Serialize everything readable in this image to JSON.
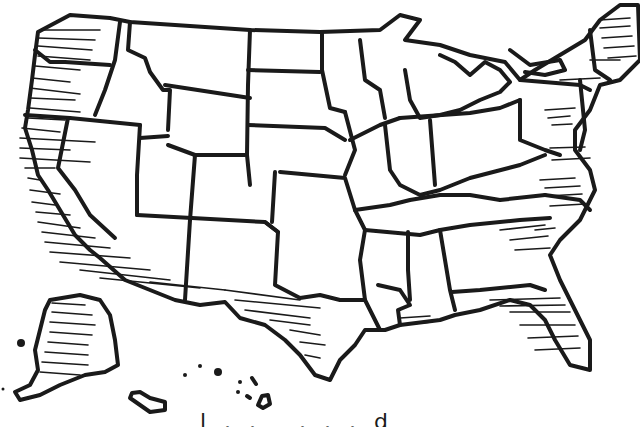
{
  "map": {
    "title": "",
    "style": "hand-drawn outline map",
    "subject": "United States",
    "stroke_color": "#1a1a1a",
    "fill_color": "#ffffff",
    "hatched_regions": [
      "Washington",
      "Oregon",
      "California",
      "Nevada (west)",
      "Arizona (south)",
      "New Mexico (south)",
      "Texas",
      "Louisiana",
      "Florida",
      "Georgia",
      "South Carolina",
      "North Carolina",
      "Virginia",
      "Maryland",
      "Delaware",
      "New Jersey",
      "New England",
      "Alaska"
    ],
    "insets": [
      "Alaska",
      "Hawaii"
    ],
    "caption_fragment": "l.. ...d"
  }
}
